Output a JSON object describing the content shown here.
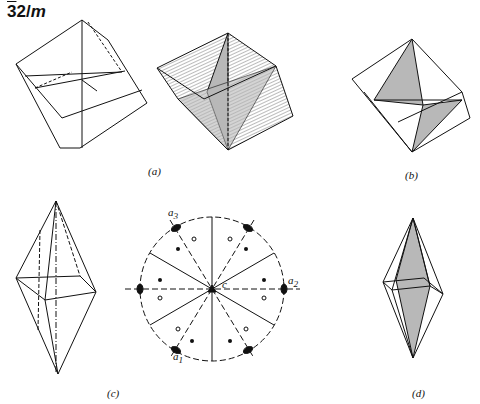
{
  "title": {
    "bar_digit": "3",
    "rest": "2/",
    "mirror": "m"
  },
  "labels": {
    "a": "(a)",
    "b": "(b)",
    "c": "(c)",
    "d": "(d)"
  },
  "stereogram": {
    "axis_a1": "a",
    "axis_a1_sub": "1",
    "axis_a2": "a",
    "axis_a2_sub": "2",
    "axis_a3": "a",
    "axis_a3_sub": "3",
    "c_axis": "c"
  },
  "colors": {
    "line": "#111111",
    "shade": "#b8b8b8",
    "hatch": "#555555"
  }
}
